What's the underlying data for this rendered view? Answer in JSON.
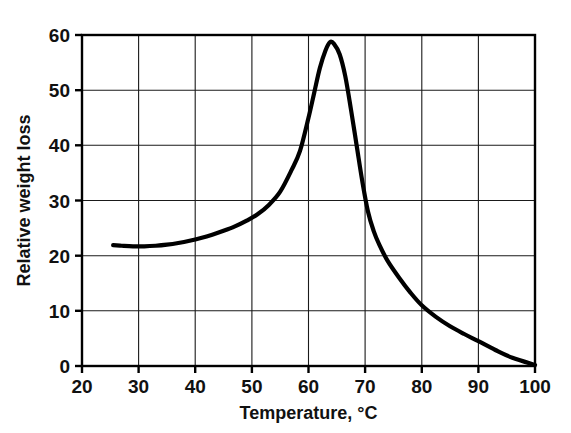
{
  "chart_data": {
    "type": "line",
    "title": "",
    "subtitle": "",
    "xlabel": "Temperature, °C",
    "ylabel": "Relative weight loss",
    "xlim": [
      20,
      100
    ],
    "ylim": [
      0,
      60
    ],
    "xticks": [
      20,
      30,
      40,
      50,
      60,
      70,
      80,
      90,
      100
    ],
    "xtick_labels": [
      "20",
      "30",
      "40",
      "50",
      "60",
      "70",
      "80",
      "90",
      "100"
    ],
    "yticks": [
      0,
      10,
      20,
      30,
      40,
      50,
      60
    ],
    "ytick_labels": [
      "0",
      "10",
      "20",
      "30",
      "40",
      "50",
      "60"
    ],
    "grid": true,
    "legend": null,
    "legend_position": "none",
    "annotations": [],
    "series": [
      {
        "name": "Relative weight loss",
        "color": "#000000",
        "x": [
          25.5,
          27,
          29,
          31,
          33,
          35,
          37,
          39,
          41,
          43,
          45,
          47,
          49,
          51,
          53,
          55,
          57,
          58.5,
          60,
          61,
          62,
          63,
          63.8,
          64.5,
          65.5,
          66.5,
          67.5,
          68.5,
          69.5,
          70.5,
          71.5,
          72.5,
          74,
          76,
          78,
          80,
          82.5,
          85,
          87.5,
          90,
          93,
          96,
          100
        ],
        "y": [
          21.9,
          21.8,
          21.7,
          21.7,
          21.8,
          22.0,
          22.3,
          22.7,
          23.2,
          23.8,
          24.5,
          25.3,
          26.3,
          27.5,
          29.2,
          31.6,
          35.5,
          39.0,
          45.0,
          49.5,
          54.0,
          57.2,
          58.7,
          58.4,
          56.5,
          52.5,
          46.5,
          40.0,
          33.5,
          28.0,
          24.5,
          22.0,
          19.0,
          16.0,
          13.3,
          11.0,
          8.9,
          7.2,
          5.8,
          4.5,
          2.9,
          1.5,
          0.2
        ]
      }
    ]
  },
  "axis": {
    "x_title": "Temperature, °C",
    "y_title": "Relative weight loss"
  }
}
